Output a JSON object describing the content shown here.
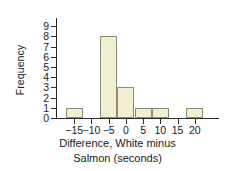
{
  "chart_data": {
    "type": "bar",
    "title": "",
    "subtitle": "",
    "xlabel": "Difference, White minus Salmon (seconds)",
    "xlabel_line1": "Difference, White minus",
    "xlabel_line2": "Salmon (seconds)",
    "ylabel": "Frequency",
    "grid": false,
    "legend": "none",
    "xlim": [
      -20,
      25
    ],
    "ylim": [
      0,
      9.6
    ],
    "xticks": [
      -15,
      -10,
      -5,
      0,
      5,
      10,
      15,
      20
    ],
    "xtick_labels": [
      "−15",
      "−10",
      "−5",
      "0",
      "5",
      "10",
      "15",
      "20"
    ],
    "yticks": [
      0,
      1,
      2,
      3,
      4,
      5,
      6,
      7,
      8,
      9
    ],
    "ytick_labels": [
      "0",
      "1",
      "2",
      "3",
      "4",
      "5",
      "6",
      "7",
      "8",
      "9"
    ],
    "bin_width": 5,
    "bins": [
      {
        "left": -17.5,
        "right": -12.5,
        "center": -15,
        "frequency": 1
      },
      {
        "left": -12.5,
        "right": -7.5,
        "center": -10,
        "frequency": 0
      },
      {
        "left": -7.5,
        "right": -2.5,
        "center": -5,
        "frequency": 8
      },
      {
        "left": -2.5,
        "right": 2.5,
        "center": 0,
        "frequency": 3
      },
      {
        "left": 2.5,
        "right": 7.5,
        "center": 5,
        "frequency": 1
      },
      {
        "left": 7.5,
        "right": 12.5,
        "center": 10,
        "frequency": 1
      },
      {
        "left": 12.5,
        "right": 17.5,
        "center": 15,
        "frequency": 0
      },
      {
        "left": 17.5,
        "right": 22.5,
        "center": 20,
        "frequency": 1
      }
    ],
    "categories": [
      "-15",
      "-10",
      "-5",
      "0",
      "5",
      "10",
      "15",
      "20"
    ],
    "values": [
      1,
      0,
      8,
      3,
      1,
      1,
      0,
      1
    ],
    "total_count": 15,
    "colors": {
      "bar_fill": "#f4eed0",
      "bar_edge": "#8a8a7a",
      "axis": "#2b2b2b",
      "text": "#1a1a1a",
      "background": "#ffffff"
    }
  }
}
